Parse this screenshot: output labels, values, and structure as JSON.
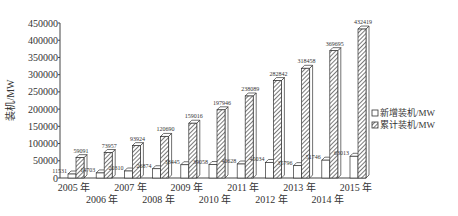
{
  "chart_data": {
    "type": "bar",
    "title": "",
    "xlabel": "",
    "ylabel": "装机/MW",
    "ylim": [
      0,
      450000
    ],
    "yticks": [
      0,
      50000,
      100000,
      150000,
      200000,
      250000,
      300000,
      350000,
      400000,
      450000
    ],
    "grid": false,
    "legend_position": "right",
    "categories": [
      "2005 年",
      "2006 年",
      "2007 年",
      "2008 年",
      "2009 年",
      "2010 年",
      "2011 年",
      "2012 年",
      "2013 年",
      "2014 年",
      "2015 年"
    ],
    "series": [
      {
        "name": "新增装机/MW",
        "values": [
          11531,
          14703,
          20310,
          26874,
          38445,
          39058,
          40628,
          45034,
          35796,
          51746,
          63013
        ]
      },
      {
        "name": "累计装机/MW",
        "values": [
          59091,
          73957,
          93924,
          120690,
          159016,
          197946,
          238089,
          282842,
          318458,
          369695,
          432419
        ]
      }
    ]
  }
}
